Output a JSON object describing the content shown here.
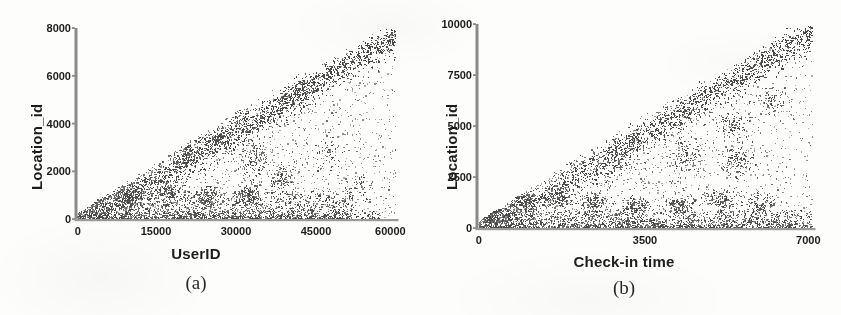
{
  "figure": {
    "background": "#fdfdfc",
    "ink_color": "#1c1c1c",
    "point_color": "#6b6b6b",
    "panels": [
      "a",
      "b"
    ]
  },
  "panel_a": {
    "caption": "(a)",
    "xlabel": "UserID",
    "ylabel": "Location_id",
    "xticks": [
      "0",
      "15000",
      "30000",
      "45000",
      "60000"
    ],
    "yticks": [
      "0",
      "2000",
      "4000",
      "6000",
      "8000"
    ]
  },
  "panel_b": {
    "caption": "(b)",
    "xlabel": "Check-in time",
    "ylabel": "Location_id",
    "xticks": [
      "0",
      "3500",
      "7000"
    ],
    "yticks": [
      "0",
      "2500",
      "5000",
      "7500",
      "10000"
    ]
  },
  "chart_data": [
    {
      "type": "scatter",
      "panel": "a",
      "title": "(a)",
      "xlabel": "UserID",
      "ylabel": "Location_id",
      "xlim": [
        0,
        60000
      ],
      "ylim": [
        0,
        8000
      ],
      "xticks": [
        0,
        15000,
        30000,
        45000,
        60000
      ],
      "yticks": [
        0,
        2000,
        4000,
        6000,
        8000
      ],
      "grid": false,
      "legend": "none",
      "marker_color": "#6b6b6b",
      "marker_size": 1.3,
      "n_points": 6200,
      "description": "Dense triangular cloud of check-in records. A strong linear upper-envelope band runs from the origin to the top-right corner (Location_id grows roughly proportionally with UserID), with a sparse scatter filling the region beneath it and a very dense horizontal band of points at low Location_id (0-1200) spanning all UserIDs. Several compact blob clusters sit inside the triangle.",
      "structures": [
        {
          "kind": "diagonal-envelope-band",
          "from": [
            0,
            0
          ],
          "to": [
            60000,
            8000
          ],
          "thickness_y": 700,
          "weight": 0.34
        },
        {
          "kind": "secondary-diagonal",
          "from": [
            0,
            0
          ],
          "to": [
            38000,
            7200
          ],
          "thickness_y": 900,
          "weight": 0.12
        },
        {
          "kind": "low-horizontal-band",
          "y_range": [
            0,
            1200
          ],
          "x_range": [
            0,
            52000
          ],
          "weight": 0.3
        },
        {
          "kind": "interior-fill",
          "x_range": [
            0,
            60000
          ],
          "y_range": [
            0,
            8000
          ],
          "weight": 0.24
        }
      ],
      "clusters": [
        {
          "x": 3000,
          "y": 900,
          "rx": 2600,
          "ry": 520,
          "n": 190
        },
        {
          "x": 9500,
          "y": 1000,
          "rx": 2400,
          "ry": 480,
          "n": 150
        },
        {
          "x": 17500,
          "y": 1150,
          "rx": 2300,
          "ry": 470,
          "n": 150
        },
        {
          "x": 24500,
          "y": 950,
          "rx": 2300,
          "ry": 470,
          "n": 140
        },
        {
          "x": 32500,
          "y": 1000,
          "rx": 2400,
          "ry": 480,
          "n": 150
        },
        {
          "x": 38500,
          "y": 1650,
          "rx": 2200,
          "ry": 600,
          "n": 100
        },
        {
          "x": 20500,
          "y": 2700,
          "rx": 2700,
          "ry": 650,
          "n": 130
        },
        {
          "x": 26500,
          "y": 3300,
          "rx": 2500,
          "ry": 640,
          "n": 110
        },
        {
          "x": 33500,
          "y": 2600,
          "rx": 2400,
          "ry": 700,
          "n": 120
        },
        {
          "x": 13500,
          "y": 4600,
          "rx": 2400,
          "ry": 700,
          "n": 110
        },
        {
          "x": 30500,
          "y": 4400,
          "rx": 2600,
          "ry": 700,
          "n": 90
        },
        {
          "x": 42000,
          "y": 5600,
          "rx": 2400,
          "ry": 650,
          "n": 70
        },
        {
          "x": 47000,
          "y": 2700,
          "rx": 2600,
          "ry": 700,
          "n": 55
        },
        {
          "x": 53000,
          "y": 1400,
          "rx": 3000,
          "ry": 600,
          "n": 45
        }
      ]
    },
    {
      "type": "scatter",
      "panel": "b",
      "title": "(b)",
      "xlabel": "Check-in time",
      "ylabel": "Location_id",
      "xlim": [
        0,
        7000
      ],
      "ylim": [
        0,
        10000
      ],
      "xticks": [
        0,
        3500,
        7000
      ],
      "yticks": [
        0,
        2500,
        5000,
        7500,
        10000
      ],
      "grid": false,
      "legend": "none",
      "marker_color": "#6b6b6b",
      "marker_size": 1.3,
      "n_points": 6000,
      "description": "Triangular scatter of Location_id versus Check-in time. A dense diagonal upper-envelope band rises from the origin to the top-right corner, beneath which a diffuse cloud fills the triangle; a very dense horizontal band of points hugs low Location_id (0-900) across the full time range, and several compact blobs appear in the right half.",
      "structures": [
        {
          "kind": "diagonal-envelope-band",
          "from": [
            0,
            0
          ],
          "to": [
            7000,
            10000
          ],
          "thickness_y": 900,
          "weight": 0.33
        },
        {
          "kind": "secondary-diagonal",
          "from": [
            0,
            0
          ],
          "to": [
            5200,
            9000
          ],
          "thickness_y": 1100,
          "weight": 0.12
        },
        {
          "kind": "low-horizontal-band",
          "y_range": [
            0,
            900
          ],
          "x_range": [
            0,
            7000
          ],
          "weight": 0.3
        },
        {
          "kind": "interior-fill",
          "x_range": [
            0,
            7000
          ],
          "y_range": [
            0,
            10000
          ],
          "weight": 0.25
        }
      ],
      "clusters": [
        {
          "x": 250,
          "y": 700,
          "rx": 260,
          "ry": 500,
          "n": 210
        },
        {
          "x": 950,
          "y": 1400,
          "rx": 330,
          "ry": 520,
          "n": 160
        },
        {
          "x": 1700,
          "y": 1500,
          "rx": 300,
          "ry": 520,
          "n": 140
        },
        {
          "x": 2450,
          "y": 1250,
          "rx": 300,
          "ry": 500,
          "n": 140
        },
        {
          "x": 3300,
          "y": 1100,
          "rx": 300,
          "ry": 480,
          "n": 130
        },
        {
          "x": 4150,
          "y": 1150,
          "rx": 300,
          "ry": 480,
          "n": 120
        },
        {
          "x": 5100,
          "y": 1450,
          "rx": 320,
          "ry": 560,
          "n": 130
        },
        {
          "x": 5900,
          "y": 1200,
          "rx": 330,
          "ry": 520,
          "n": 120
        },
        {
          "x": 2900,
          "y": 3300,
          "rx": 340,
          "ry": 700,
          "n": 110
        },
        {
          "x": 4350,
          "y": 3600,
          "rx": 320,
          "ry": 700,
          "n": 100
        },
        {
          "x": 5400,
          "y": 3350,
          "rx": 330,
          "ry": 760,
          "n": 130
        },
        {
          "x": 5300,
          "y": 5100,
          "rx": 330,
          "ry": 720,
          "n": 90
        },
        {
          "x": 6150,
          "y": 6200,
          "rx": 330,
          "ry": 760,
          "n": 70
        },
        {
          "x": 1750,
          "y": 5000,
          "rx": 300,
          "ry": 700,
          "n": 80
        }
      ]
    }
  ]
}
